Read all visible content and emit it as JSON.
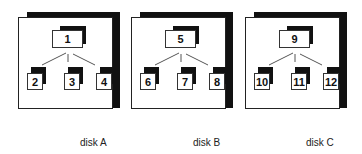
{
  "disks": [
    {
      "label": "disk A",
      "root": "1",
      "children": [
        "2",
        "3",
        "4"
      ]
    },
    {
      "label": "disk B",
      "root": "5",
      "children": [
        "6",
        "7",
        "8"
      ]
    },
    {
      "label": "disk C",
      "root": "9",
      "children": [
        "10",
        "11",
        "12"
      ]
    }
  ],
  "colors": {
    "shadow": "#111111",
    "border": "#222222",
    "background": "#ffffff"
  }
}
